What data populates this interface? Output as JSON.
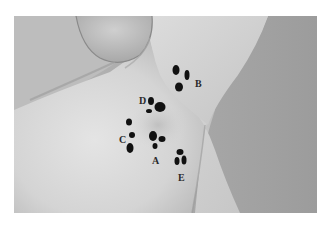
{
  "figure": {
    "markers": [
      {
        "label": "A",
        "label_pos": [
          152,
          156
        ],
        "dots": [
          [
            153,
            136,
            4,
            5
          ],
          [
            162,
            139,
            3.5,
            3
          ],
          [
            155,
            146,
            2.5,
            3
          ]
        ]
      },
      {
        "label": "B",
        "label_pos": [
          195,
          79
        ],
        "dots": [
          [
            176,
            70,
            3.5,
            5
          ],
          [
            187,
            75,
            2.5,
            5
          ],
          [
            179,
            87,
            4,
            4.5
          ]
        ]
      },
      {
        "label": "C",
        "label_pos": [
          119,
          135
        ],
        "dots": [
          [
            129,
            122,
            3,
            3.5
          ],
          [
            132,
            135,
            3,
            3
          ],
          [
            130,
            148,
            3.5,
            5
          ]
        ]
      },
      {
        "label": "D",
        "label_pos": [
          139,
          96
        ],
        "dots": [
          [
            151,
            101,
            3,
            4
          ],
          [
            160,
            107,
            5.5,
            5
          ],
          [
            149,
            111,
            3,
            2
          ]
        ]
      },
      {
        "label": "E",
        "label_pos": [
          178,
          173
        ],
        "dots": [
          [
            180,
            152,
            3.5,
            3
          ],
          [
            177,
            161,
            2.5,
            4
          ],
          [
            184,
            160,
            2.5,
            4.5
          ]
        ]
      }
    ]
  }
}
